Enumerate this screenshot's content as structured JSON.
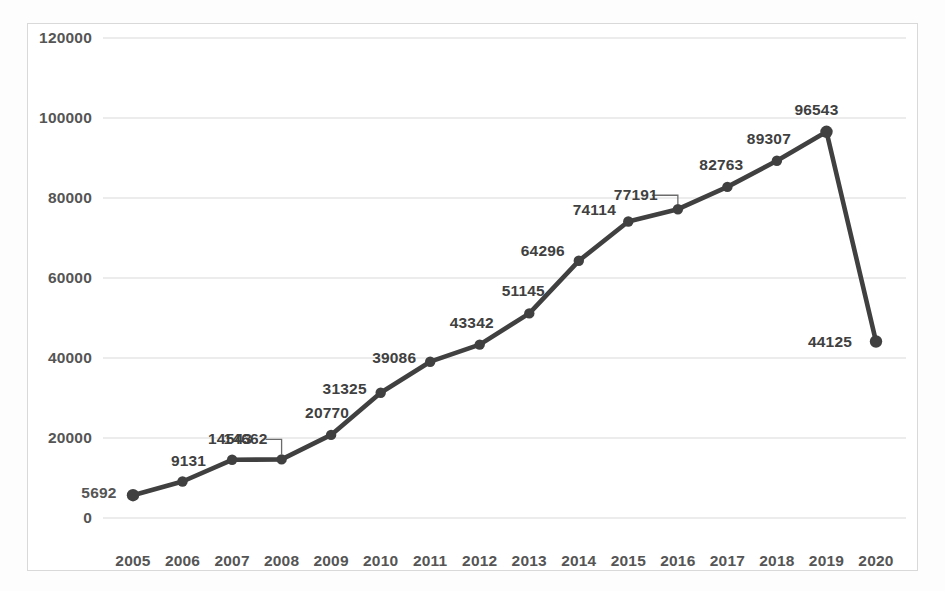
{
  "chart_data": {
    "type": "line",
    "title": "",
    "subtitle": "",
    "xlabel": "",
    "ylabel": "",
    "categories": [
      "2005",
      "2006",
      "2007",
      "2008",
      "2009",
      "2010",
      "2011",
      "2012",
      "2013",
      "2014",
      "2015",
      "2016",
      "2017",
      "2018",
      "2019",
      "2020"
    ],
    "values": [
      5692,
      9131,
      14543,
      14662,
      20770,
      31325,
      39086,
      43342,
      51145,
      64296,
      74114,
      77191,
      82763,
      89307,
      96543,
      44125
    ],
    "point_labels": [
      "5692",
      "9131",
      "14543",
      "14662",
      "20770",
      "31325",
      "39086",
      "43342",
      "51145",
      "64296",
      "74114",
      "77191",
      "82763",
      "89307",
      "96543",
      "44125"
    ],
    "ylim": [
      0,
      120000
    ],
    "ytick_labels": [
      "120000",
      "100000",
      "80000",
      "60000",
      "40000",
      "20000",
      "0"
    ],
    "ytick_values": [
      120000,
      100000,
      80000,
      60000,
      40000,
      20000,
      0
    ],
    "grid": true,
    "grid_axis": "y",
    "legend": false,
    "legend_position": "none",
    "markers": true,
    "series_color": "#404040",
    "grid_color": "#d9d9d9",
    "label_color": "#404040",
    "tick_color": "#555555",
    "background": "#ffffff",
    "border_color": "#d9d9d9",
    "leader_lines": [
      {
        "category": "2008",
        "note": "label 14662 offset left with callout leader line to its point"
      },
      {
        "category": "2016",
        "note": "label 77191 offset left with callout leader line to its point"
      }
    ],
    "annotations": [
      {
        "text": "5692",
        "category": "2005",
        "placement": "left-of-first-point"
      }
    ]
  }
}
